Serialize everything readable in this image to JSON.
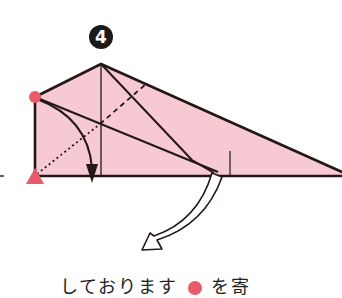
{
  "step": {
    "number": "4"
  },
  "caption": {
    "text_before": "しております",
    "text_after": "を寄"
  },
  "colors": {
    "paper": "#f7c9d2",
    "outline": "#231815",
    "marker": "#e85a6c",
    "background": "#ffffff"
  },
  "markers": [
    {
      "shape": "circle",
      "label": "start-point",
      "x": 35,
      "y": 97
    },
    {
      "shape": "triangle",
      "label": "target-point",
      "x": 35,
      "y": 176
    }
  ],
  "arrows": [
    {
      "type": "fold-arrow",
      "from": [
        35,
        97
      ],
      "to": [
        92,
        176
      ]
    },
    {
      "type": "hollow-turn-arrow",
      "from": [
        218,
        174
      ],
      "to": [
        145,
        245
      ]
    }
  ]
}
